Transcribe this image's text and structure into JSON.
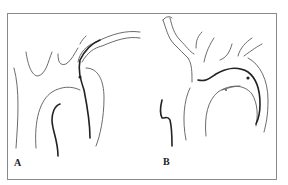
{
  "figure": {
    "panels": [
      {
        "id": "A",
        "label": "A",
        "description": "catheter looped in aortic arch, tip toward left"
      },
      {
        "id": "B",
        "label": "B",
        "description": "catheter along aortic arch with arch branches"
      }
    ],
    "colors": {
      "outline": "#5a5a5a",
      "catheter": "#222222",
      "border": "#8a8a8a",
      "background": "#ffffff"
    }
  }
}
